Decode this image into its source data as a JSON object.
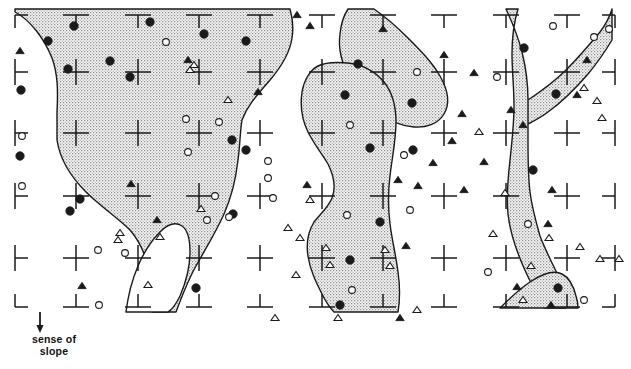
{
  "figure": {
    "kind": "geomorphological-map",
    "width": 631,
    "height": 369,
    "background_color": "#ffffff",
    "line_color": "#1a1a1a",
    "stipple_color": "#9a9a9a",
    "stipple_background": "#f2f2f2"
  },
  "annotations": {
    "slope": {
      "line1": "sense of",
      "line2": "slope",
      "arrow_icon": "down-arrow-icon",
      "arrow_x": 40,
      "arrow_y_top": 312,
      "arrow_y_bottom": 330
    }
  },
  "grid": {
    "note": "Tick marks: corner L-shapes at map corners, T-shapes along top/bottom edges, sideways T along left/right edges, full plus crosses in the interior.",
    "x_positions": [
      15,
      76,
      138,
      199,
      260,
      322,
      383,
      444,
      506,
      567,
      615
    ],
    "y_positions": [
      15,
      72,
      133,
      196,
      258,
      307
    ],
    "tick_arm": 13,
    "stroke_width": 1.5
  },
  "chart_data": {
    "type": "scatter",
    "title": "",
    "xlabel": "",
    "ylabel": "",
    "grid": true,
    "legend": "none",
    "xlim": [
      0,
      631
    ],
    "ylim": [
      369,
      0
    ],
    "series": [
      {
        "name": "filled-circle",
        "symbol": "filled circle",
        "count": 28,
        "points": [
          [
            74,
            26
          ],
          [
            150,
            22
          ],
          [
            48,
            41
          ],
          [
            204,
            34
          ],
          [
            246,
            41
          ],
          [
            110,
            61
          ],
          [
            68,
            69
          ],
          [
            130,
            77
          ],
          [
            21,
            90
          ],
          [
            232,
            140
          ],
          [
            20,
            156
          ],
          [
            80,
            199
          ],
          [
            246,
            150
          ],
          [
            233,
            214
          ],
          [
            70,
            211
          ],
          [
            196,
            288
          ],
          [
            358,
            64
          ],
          [
            345,
            95
          ],
          [
            412,
            103
          ],
          [
            370,
            148
          ],
          [
            380,
            222
          ],
          [
            350,
            260
          ],
          [
            413,
            150
          ],
          [
            524,
            48
          ],
          [
            556,
            94
          ],
          [
            533,
            170
          ],
          [
            558,
            288
          ],
          [
            340,
            305
          ]
        ]
      },
      {
        "name": "open-circle",
        "symbol": "open circle",
        "count": 24,
        "points": [
          [
            166,
            42
          ],
          [
            22,
            136
          ],
          [
            186,
            119
          ],
          [
            219,
            122
          ],
          [
            188,
            152
          ],
          [
            268,
            161
          ],
          [
            215,
            196
          ],
          [
            268,
            178
          ],
          [
            98,
            250
          ],
          [
            22,
            186
          ],
          [
            273,
            198
          ],
          [
            207,
            220
          ],
          [
            229,
            217
          ],
          [
            99,
            305
          ],
          [
            350,
            125
          ],
          [
            347,
            215
          ],
          [
            404,
            155
          ],
          [
            352,
            290
          ],
          [
            410,
            210
          ],
          [
            417,
            72
          ],
          [
            497,
            77
          ],
          [
            528,
            224
          ],
          [
            553,
            26
          ],
          [
            609,
            29
          ],
          [
            594,
            37
          ],
          [
            584,
            300
          ],
          [
            488,
            272
          ],
          [
            125,
            253
          ]
        ]
      },
      {
        "name": "filled-triangle",
        "symbol": "filled triangle",
        "count": 26,
        "points": [
          [
            20,
            51
          ],
          [
            258,
            92
          ],
          [
            188,
            60
          ],
          [
            297,
            15
          ],
          [
            131,
            184
          ],
          [
            157,
            220
          ],
          [
            82,
            286
          ],
          [
            307,
            185
          ],
          [
            310,
            26
          ],
          [
            383,
            29
          ],
          [
            444,
            55
          ],
          [
            474,
            73
          ],
          [
            462,
            114
          ],
          [
            452,
            141
          ],
          [
            433,
            163
          ],
          [
            398,
            180
          ],
          [
            418,
            186
          ],
          [
            464,
            190
          ],
          [
            484,
            162
          ],
          [
            511,
            110
          ],
          [
            523,
            125
          ],
          [
            406,
            246
          ],
          [
            552,
            190
          ],
          [
            548,
            224
          ],
          [
            587,
            60
          ],
          [
            577,
            95
          ],
          [
            551,
            305
          ],
          [
            517,
            287
          ],
          [
            400,
            318
          ]
        ]
      },
      {
        "name": "open-triangle",
        "symbol": "open triangle",
        "count": 25,
        "points": [
          [
            190,
            70
          ],
          [
            228,
            100
          ],
          [
            194,
            65
          ],
          [
            120,
            233
          ],
          [
            160,
            237
          ],
          [
            118,
            240
          ],
          [
            201,
            209
          ],
          [
            148,
            285
          ],
          [
            288,
            228
          ],
          [
            300,
            238
          ],
          [
            326,
            248
          ],
          [
            330,
            265
          ],
          [
            296,
            275
          ],
          [
            338,
            318
          ],
          [
            385,
            250
          ],
          [
            390,
            266
          ],
          [
            417,
            310
          ],
          [
            479,
            132
          ],
          [
            493,
            234
          ],
          [
            505,
            193
          ],
          [
            584,
            88
          ],
          [
            597,
            101
          ],
          [
            602,
            118
          ],
          [
            549,
            238
          ],
          [
            580,
            247
          ],
          [
            600,
            259
          ],
          [
            619,
            259
          ],
          [
            531,
            266
          ],
          [
            523,
            300
          ],
          [
            310,
            200
          ],
          [
            275,
            318
          ]
        ]
      }
    ]
  },
  "polygons": [
    {
      "name": "left-main-region",
      "fill": "stipple",
      "path": "M 15,9 L 15,12 C 30,20 44,38 52,58 C 58,74 58,92 57,112 L 57,140 C 60,160 72,178 86,192 C 100,206 118,218 130,230 C 142,244 148,262 150,278 C 152,292 152,302 152,312 L 176,312 C 182,296 188,280 196,266 C 206,248 216,232 224,214 C 232,196 236,178 238,160 C 240,146 240,132 242,120 C 248,104 260,92 270,80 C 282,66 290,52 292,38 C 294,26 292,16 290,9 Z"
    },
    {
      "name": "left-main-inner-notch",
      "fill": "white",
      "path": "M 126,312 C 128,296 132,280 138,266 C 144,252 152,240 160,232 C 168,224 176,222 182,226 C 188,230 190,240 190,252 C 190,266 186,282 180,296 C 176,304 172,310 168,312 Z"
    },
    {
      "name": "upper-middle-teardrop",
      "fill": "stipple",
      "path": "M 374,9 C 384,16 396,26 408,38 C 420,50 432,62 440,76 C 448,90 450,104 444,114 C 438,124 426,128 414,127 C 400,126 388,120 378,112 C 366,102 356,90 350,78 C 342,64 338,48 340,34 C 341,24 344,15 348,9 Z"
    },
    {
      "name": "middle-finger-region",
      "fill": "stipple",
      "path": "M 318,66 C 310,70 304,80 302,92 C 300,106 302,120 308,132 C 314,144 322,154 328,164 C 334,176 336,188 332,198 C 328,208 320,214 314,222 C 308,232 306,244 308,256 C 310,270 316,282 322,294 C 326,302 330,308 334,312 L 398,312 C 400,300 400,286 398,272 C 396,256 392,240 390,224 C 388,208 388,192 390,176 C 392,158 396,140 396,122 C 396,106 392,92 384,82 C 374,70 360,64 348,63 C 336,62 326,62 318,66 Z"
    },
    {
      "name": "right-main-region",
      "fill": "stipple",
      "path": "M 506,9 C 512,22 518,36 522,52 C 526,68 528,84 528,100 L 528,140 C 528,158 528,176 530,192 C 532,208 536,222 540,236 C 546,252 554,266 560,280 C 564,290 566,300 566,308 L 544,308 C 538,296 530,282 524,268 C 516,250 510,232 508,214 C 506,196 508,178 510,160 C 512,142 514,124 514,106 C 514,88 512,70 512,54 C 512,38 514,22 518,9 Z M 528,100 C 540,92 554,82 566,70 C 578,58 590,44 600,32 C 606,24 610,16 612,9 L 612,40 C 606,50 598,62 588,74 C 576,88 562,102 548,112 C 540,118 532,122 528,124 Z"
    },
    {
      "name": "bottom-right-dome",
      "fill": "stipple",
      "path": "M 500,308 C 508,300 518,290 530,282 C 542,274 554,270 562,274 C 570,278 574,288 576,296 C 578,302 578,306 578,308 Z"
    }
  ]
}
